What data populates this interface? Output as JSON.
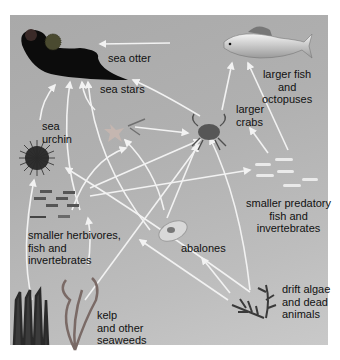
{
  "diagram": {
    "type": "food-web",
    "colors": {
      "panel": "#b3b3b3",
      "arrow": "#f2f2f2",
      "text": "#111111"
    },
    "nodes": {
      "sea_otter": {
        "label": "sea otter"
      },
      "larger_fish": {
        "label": "larger fish\nand\noctopuses"
      },
      "sea_stars": {
        "label": "sea stars"
      },
      "larger_crabs": {
        "label": "larger\ncrabs"
      },
      "sea_urchin": {
        "label": "sea\nurchin"
      },
      "smaller_predatory": {
        "label": "smaller predatory\nfish and\ninvertebrates"
      },
      "smaller_herbivores": {
        "label": "smaller herbivores,\nfish and\ninvertebrates"
      },
      "abalones": {
        "label": "abalones"
      },
      "kelp": {
        "label": "kelp\nand other\nseaweeds"
      },
      "drift_algae": {
        "label": "drift algae\nand dead\nanimals"
      }
    },
    "edges": [
      [
        "larger_fish",
        "sea_otter"
      ],
      [
        "larger_crabs",
        "sea_otter"
      ],
      [
        "sea_urchin",
        "sea_otter"
      ],
      [
        "smaller_herbivores",
        "sea_otter"
      ],
      [
        "sea_stars",
        "sea_otter"
      ],
      [
        "abalones",
        "sea_otter"
      ],
      [
        "larger_crabs",
        "larger_fish"
      ],
      [
        "smaller_predatory",
        "larger_fish"
      ],
      [
        "sea_stars",
        "larger_crabs"
      ],
      [
        "smaller_herbivores",
        "larger_crabs"
      ],
      [
        "abalones",
        "larger_crabs"
      ],
      [
        "kelp",
        "larger_crabs"
      ],
      [
        "drift_algae",
        "larger_crabs"
      ],
      [
        "smaller_predatory",
        "larger_crabs"
      ],
      [
        "smaller_herbivores",
        "sea_stars"
      ],
      [
        "abalones",
        "sea_stars"
      ],
      [
        "smaller_herbivores",
        "smaller_predatory"
      ],
      [
        "drift_algae",
        "smaller_predatory"
      ],
      [
        "kelp",
        "sea_urchin"
      ],
      [
        "drift_algae",
        "sea_urchin"
      ],
      [
        "kelp",
        "smaller_herbivores"
      ],
      [
        "kelp",
        "abalones"
      ],
      [
        "drift_algae",
        "abalones"
      ],
      [
        "drift_algae",
        "smaller_herbivores"
      ]
    ]
  }
}
